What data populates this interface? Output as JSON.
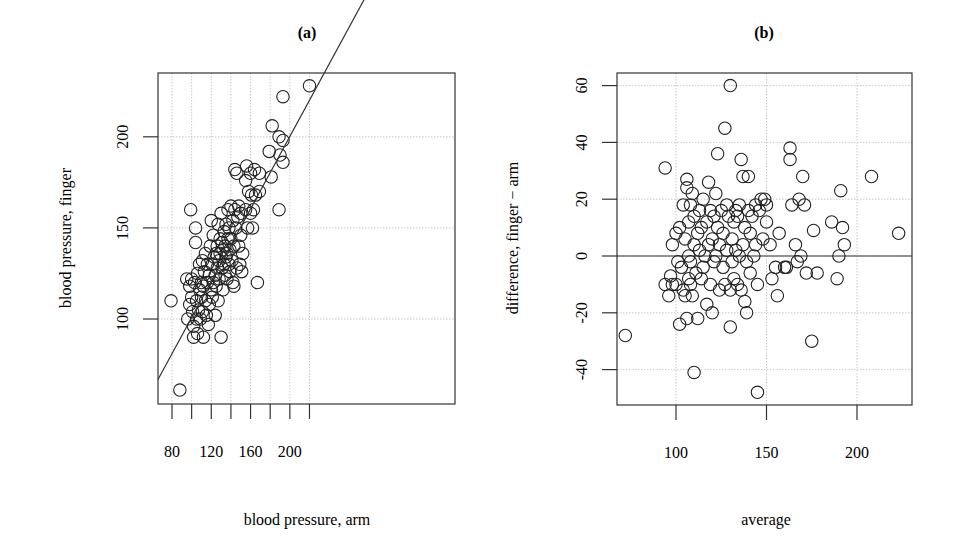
{
  "figure": {
    "panels": [
      {
        "id": "a",
        "title": "(a)"
      },
      {
        "id": "b",
        "title": "(b)"
      }
    ]
  },
  "chart_data": [
    {
      "type": "scatter",
      "title": "(a)",
      "xlabel": "blood pressure, arm",
      "ylabel": "blood pressure, finger",
      "xlim": [
        73,
        225
      ],
      "ylim": [
        53,
        235
      ],
      "xticks": [
        80,
        120,
        160,
        200
      ],
      "xticks_minor": [
        80,
        100,
        120,
        140,
        160,
        180,
        200,
        220
      ],
      "yticks": [
        100,
        150,
        200
      ],
      "grid": true,
      "line": {
        "type": "regression",
        "x": [
          73,
          225
        ],
        "y": [
          74,
          225
        ]
      },
      "points": [
        [
          79,
          110
        ],
        [
          88,
          61
        ],
        [
          95,
          122
        ],
        [
          96,
          100
        ],
        [
          98,
          108
        ],
        [
          98,
          118
        ],
        [
          99,
          160
        ],
        [
          100,
          112
        ],
        [
          100,
          122
        ],
        [
          101,
          104
        ],
        [
          102,
          96
        ],
        [
          102,
          90
        ],
        [
          103,
          120
        ],
        [
          104,
          142
        ],
        [
          104,
          150
        ],
        [
          105,
          110
        ],
        [
          105,
          100
        ],
        [
          106,
          92
        ],
        [
          106,
          125
        ],
        [
          107,
          105
        ],
        [
          108,
          116
        ],
        [
          108,
          130
        ],
        [
          109,
          100
        ],
        [
          110,
          120
        ],
        [
          110,
          112
        ],
        [
          111,
          132
        ],
        [
          111,
          104
        ],
        [
          112,
          90
        ],
        [
          112,
          118
        ],
        [
          113,
          126
        ],
        [
          114,
          110
        ],
        [
          114,
          136
        ],
        [
          115,
          102
        ],
        [
          116,
          120
        ],
        [
          116,
          130
        ],
        [
          117,
          97
        ],
        [
          118,
          108
        ],
        [
          118,
          124
        ],
        [
          119,
          140
        ],
        [
          120,
          154
        ],
        [
          120,
          116
        ],
        [
          121,
          130
        ],
        [
          121,
          112
        ],
        [
          122,
          120
        ],
        [
          122,
          146
        ],
        [
          123,
          134
        ],
        [
          124,
          124
        ],
        [
          124,
          102
        ],
        [
          125,
          136
        ],
        [
          125,
          118
        ],
        [
          126,
          128
        ],
        [
          126,
          140
        ],
        [
          127,
          110
        ],
        [
          127,
          152
        ],
        [
          128,
          132
        ],
        [
          128,
          122
        ],
        [
          129,
          144
        ],
        [
          129,
          136
        ],
        [
          130,
          90
        ],
        [
          130,
          158
        ],
        [
          131,
          128
        ],
        [
          131,
          142
        ],
        [
          132,
          138
        ],
        [
          132,
          116
        ],
        [
          133,
          130
        ],
        [
          133,
          148
        ],
        [
          134,
          124
        ],
        [
          134,
          140
        ],
        [
          135,
          134
        ],
        [
          135,
          152
        ],
        [
          136,
          136
        ],
        [
          136,
          122
        ],
        [
          137,
          144
        ],
        [
          137,
          160
        ],
        [
          138,
          130
        ],
        [
          138,
          150
        ],
        [
          139,
          126
        ],
        [
          139,
          138
        ],
        [
          140,
          162
        ],
        [
          140,
          144
        ],
        [
          141,
          132
        ],
        [
          142,
          154
        ],
        [
          142,
          120
        ],
        [
          143,
          118
        ],
        [
          143,
          140
        ],
        [
          144,
          182
        ],
        [
          144,
          160
        ],
        [
          145,
          150
        ],
        [
          146,
          180
        ],
        [
          146,
          128
        ],
        [
          147,
          156
        ],
        [
          148,
          162
        ],
        [
          148,
          140
        ],
        [
          149,
          130
        ],
        [
          150,
          158
        ],
        [
          150,
          146
        ],
        [
          151,
          126
        ],
        [
          152,
          136
        ],
        [
          155,
          160
        ],
        [
          155,
          176
        ],
        [
          156,
          184
        ],
        [
          157,
          150
        ],
        [
          158,
          170
        ],
        [
          160,
          180
        ],
        [
          160,
          158
        ],
        [
          161,
          168
        ],
        [
          162,
          150
        ],
        [
          163,
          160
        ],
        [
          164,
          182
        ],
        [
          165,
          168
        ],
        [
          167,
          120
        ],
        [
          169,
          170
        ],
        [
          169,
          180
        ],
        [
          179,
          192
        ],
        [
          181,
          178
        ],
        [
          182,
          206
        ],
        [
          189,
          160
        ],
        [
          189,
          200
        ],
        [
          190,
          190
        ],
        [
          193,
          198
        ],
        [
          193,
          186
        ],
        [
          193,
          222
        ],
        [
          220,
          228
        ]
      ]
    },
    {
      "type": "scatter",
      "title": "(b)",
      "xlabel": "average",
      "ylabel": "difference, finger − arm",
      "xlim": [
        67,
        230
      ],
      "ylim": [
        -53,
        65
      ],
      "xticks": [
        100,
        150,
        200
      ],
      "yticks": [
        -40,
        -20,
        0,
        20,
        40,
        60
      ],
      "grid": true,
      "hline": 0,
      "points": [
        [
          72,
          -28
        ],
        [
          94,
          -10
        ],
        [
          94,
          31
        ],
        [
          96,
          -14
        ],
        [
          97,
          -7
        ],
        [
          98,
          -10
        ],
        [
          98,
          4
        ],
        [
          100,
          -10
        ],
        [
          100,
          8
        ],
        [
          101,
          -2
        ],
        [
          102,
          -24
        ],
        [
          102,
          10
        ],
        [
          103,
          -4
        ],
        [
          104,
          18
        ],
        [
          104,
          -12
        ],
        [
          105,
          -14
        ],
        [
          105,
          6
        ],
        [
          106,
          24
        ],
        [
          106,
          -22
        ],
        [
          106,
          27
        ],
        [
          107,
          0
        ],
        [
          107,
          -8
        ],
        [
          107,
          12
        ],
        [
          108,
          -10
        ],
        [
          108,
          18
        ],
        [
          108,
          -2
        ],
        [
          109,
          22
        ],
        [
          109,
          -14
        ],
        [
          110,
          4
        ],
        [
          110,
          -41
        ],
        [
          110,
          14
        ],
        [
          111,
          -6
        ],
        [
          112,
          8
        ],
        [
          112,
          -22
        ],
        [
          113,
          16
        ],
        [
          113,
          2
        ],
        [
          114,
          -8
        ],
        [
          114,
          10
        ],
        [
          115,
          -4
        ],
        [
          115,
          20
        ],
        [
          116,
          0
        ],
        [
          117,
          12
        ],
        [
          117,
          -17
        ],
        [
          118,
          4
        ],
        [
          118,
          26
        ],
        [
          119,
          -10
        ],
        [
          119,
          16
        ],
        [
          120,
          -20
        ],
        [
          120,
          6
        ],
        [
          121,
          -2
        ],
        [
          121,
          14
        ],
        [
          122,
          22
        ],
        [
          122,
          0
        ],
        [
          123,
          10
        ],
        [
          123,
          36
        ],
        [
          124,
          -12
        ],
        [
          124,
          4
        ],
        [
          125,
          16
        ],
        [
          126,
          -4
        ],
        [
          126,
          8
        ],
        [
          127,
          45
        ],
        [
          127,
          -10
        ],
        [
          128,
          18
        ],
        [
          128,
          2
        ],
        [
          129,
          14
        ],
        [
          130,
          -25
        ],
        [
          130,
          60
        ],
        [
          130,
          -12
        ],
        [
          131,
          6
        ],
        [
          131,
          -2
        ],
        [
          132,
          12
        ],
        [
          132,
          -8
        ],
        [
          133,
          16
        ],
        [
          133,
          2
        ],
        [
          134,
          -10
        ],
        [
          134,
          14
        ],
        [
          135,
          18
        ],
        [
          135,
          0
        ],
        [
          136,
          34
        ],
        [
          136,
          -12
        ],
        [
          137,
          4
        ],
        [
          137,
          28
        ],
        [
          138,
          -16
        ],
        [
          138,
          10
        ],
        [
          139,
          -20
        ],
        [
          139,
          -2
        ],
        [
          140,
          16
        ],
        [
          140,
          28
        ],
        [
          141,
          8
        ],
        [
          141,
          -6
        ],
        [
          142,
          14
        ],
        [
          143,
          0
        ],
        [
          144,
          18
        ],
        [
          144,
          4
        ],
        [
          145,
          -48
        ],
        [
          145,
          -10
        ],
        [
          146,
          16
        ],
        [
          147,
          20
        ],
        [
          148,
          6
        ],
        [
          149,
          20
        ],
        [
          150,
          12
        ],
        [
          150,
          18
        ],
        [
          152,
          4
        ],
        [
          153,
          -8
        ],
        [
          155,
          -4
        ],
        [
          156,
          -14
        ],
        [
          157,
          8
        ],
        [
          160,
          -4
        ],
        [
          161,
          -4
        ],
        [
          163,
          34
        ],
        [
          163,
          38
        ],
        [
          164,
          18
        ],
        [
          166,
          4
        ],
        [
          167,
          -2
        ],
        [
          168,
          20
        ],
        [
          169,
          0
        ],
        [
          170,
          28
        ],
        [
          171,
          18
        ],
        [
          172,
          -6
        ],
        [
          175,
          -30
        ],
        [
          176,
          9
        ],
        [
          178,
          -6
        ],
        [
          186,
          12
        ],
        [
          189,
          -8
        ],
        [
          190,
          0
        ],
        [
          191,
          23
        ],
        [
          192,
          10
        ],
        [
          193,
          4
        ],
        [
          208,
          28
        ],
        [
          223,
          8
        ]
      ]
    }
  ]
}
